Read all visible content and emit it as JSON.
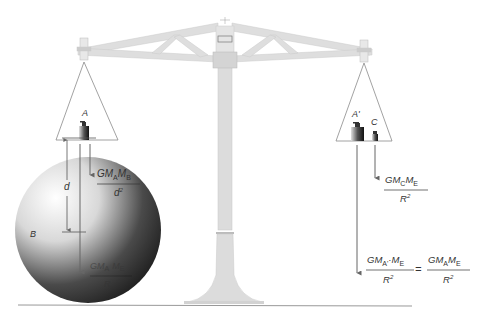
{
  "diagram": {
    "labels": {
      "mass_a": "A",
      "mass_a_prime": "A'",
      "mass_c": "C",
      "sphere_b": "B",
      "distance": "d"
    },
    "formulas": {
      "f_ab": {
        "numerator": "GM_A M_B",
        "denominator": "d^2",
        "num_main": "GM",
        "num_sub1": "A",
        "num_mid": "M",
        "num_sub2": "B",
        "den": "d",
        "den_sup": "2"
      },
      "f_ae": {
        "num_main": "GM",
        "num_sub1": "A",
        "num_mid": "M",
        "num_sub2": "E",
        "den": "R"
      },
      "f_ce": {
        "num_main": "GM",
        "num_sub1": "C",
        "num_mid": "M",
        "num_sub2": "E",
        "den": "R",
        "den_sup": "2"
      },
      "f_aprime_e": {
        "num_main": "GM",
        "num_sub1": "A'",
        "num_mid": "·M",
        "num_sub2": "E",
        "den": "R",
        "den_sup": "2"
      },
      "f_a_e_right": {
        "num_main": "GM",
        "num_sub1": "A",
        "num_mid": "M",
        "num_sub2": "E",
        "den": "R",
        "den_sup": "2"
      },
      "equals": "="
    },
    "colors": {
      "balance": "#d9d9d9",
      "balance_edge": "#bdbdbd",
      "arrow": "#777777",
      "text": "#333333",
      "ground": "#999999"
    }
  }
}
